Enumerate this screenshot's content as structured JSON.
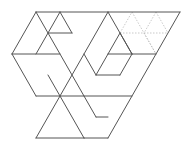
{
  "diagram": {
    "title": "",
    "colors": {
      "line": "#555555",
      "dotted_line": "#bbbbbb",
      "background": "#ffffff"
    },
    "solid_segments": [
      [
        36,
        12,
        180,
        12
      ],
      [
        36,
        12,
        12,
        54
      ],
      [
        36,
        12,
        84,
        96
      ],
      [
        60,
        12,
        36,
        54
      ],
      [
        60,
        12,
        72,
        33
      ],
      [
        48,
        33,
        72,
        33
      ],
      [
        12,
        54,
        60,
        54
      ],
      [
        12,
        54,
        36,
        96
      ],
      [
        108,
        12,
        60,
        96
      ],
      [
        108,
        12,
        132,
        54
      ],
      [
        180,
        12,
        108,
        138
      ],
      [
        108,
        54,
        156,
        54
      ],
      [
        120,
        33,
        108,
        54
      ],
      [
        120,
        33,
        132,
        54
      ],
      [
        84,
        54,
        96,
        75
      ],
      [
        96,
        75,
        120,
        75
      ],
      [
        108,
        54,
        96,
        75
      ],
      [
        132,
        54,
        120,
        75
      ],
      [
        36,
        96,
        132,
        96
      ],
      [
        48,
        75,
        60,
        96
      ],
      [
        60,
        96,
        36,
        138
      ],
      [
        60,
        96,
        84,
        138
      ],
      [
        36,
        138,
        84,
        138
      ],
      [
        84,
        138,
        108,
        138
      ],
      [
        84,
        96,
        96,
        117
      ],
      [
        96,
        117,
        108,
        117
      ]
    ],
    "dotted_segments": [
      [
        120,
        33,
        168,
        33
      ],
      [
        120,
        33,
        132,
        12
      ],
      [
        132,
        12,
        156,
        54
      ],
      [
        156,
        12,
        144,
        33
      ],
      [
        144,
        33,
        156,
        54
      ],
      [
        156,
        12,
        168,
        33
      ]
    ]
  }
}
